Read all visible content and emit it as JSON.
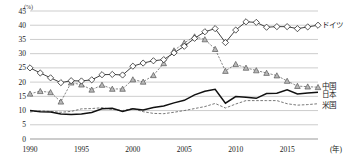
{
  "chart_data": {
    "type": "line",
    "title": "",
    "subtitle": "",
    "xlabel": "(年)",
    "ylabel": "(%)",
    "xlim": [
      1990,
      2018
    ],
    "ylim": [
      0,
      45
    ],
    "yticks": [
      0,
      5,
      10,
      15,
      20,
      25,
      30,
      35,
      40,
      45
    ],
    "xticks": [
      1990,
      1995,
      2000,
      2005,
      2010,
      2015
    ],
    "grid": true,
    "legend_position": "right",
    "x": [
      1990,
      1991,
      1992,
      1993,
      1994,
      1995,
      1996,
      1997,
      1998,
      1999,
      2000,
      2001,
      2002,
      2003,
      2004,
      2005,
      2006,
      2007,
      2008,
      2009,
      2010,
      2011,
      2012,
      2013,
      2014,
      2015,
      2016,
      2017,
      2018
    ],
    "series": [
      {
        "name": "ドイツ",
        "marker": "diamond-open",
        "color": "#111111",
        "values": [
          25.0,
          23.2,
          21.5,
          19.8,
          20.5,
          20.4,
          20.8,
          22.6,
          22.7,
          22.5,
          25.6,
          26.7,
          27.5,
          27.9,
          30.3,
          32.6,
          35.4,
          37.7,
          38.8,
          33.9,
          38.3,
          41.2,
          41.0,
          39.3,
          39.5,
          39.5,
          38.8,
          39.4,
          40.0
        ]
      },
      {
        "name": "中国",
        "marker": "triangle-filled",
        "color": "#8a8a8a",
        "values": [
          15.9,
          16.8,
          16.4,
          13.1,
          19.8,
          19.1,
          17.3,
          19.0,
          17.6,
          17.6,
          20.9,
          20.1,
          22.4,
          26.6,
          31.1,
          33.8,
          36.0,
          35.0,
          31.6,
          23.9,
          26.3,
          25.0,
          24.1,
          23.2,
          22.3,
          20.4,
          18.6,
          18.4,
          18.2
        ]
      },
      {
        "name": "日本",
        "marker": "none",
        "color": "#111111",
        "values": [
          10.0,
          9.6,
          9.5,
          8.8,
          8.6,
          8.8,
          9.3,
          10.6,
          10.8,
          9.7,
          10.6,
          10.2,
          11.1,
          11.6,
          12.7,
          13.6,
          15.5,
          16.8,
          17.5,
          12.6,
          14.9,
          14.7,
          14.3,
          16.0,
          16.1,
          17.3,
          15.8,
          16.2,
          16.4
        ]
      },
      {
        "name": "米国",
        "marker": "none",
        "color": "#6b6b6b",
        "values": [
          9.5,
          9.9,
          9.7,
          9.4,
          9.7,
          10.6,
          10.7,
          11.0,
          10.4,
          10.0,
          10.7,
          9.6,
          9.0,
          8.9,
          9.4,
          10.0,
          10.7,
          11.4,
          12.5,
          10.9,
          12.3,
          13.5,
          13.5,
          13.5,
          13.5,
          12.4,
          11.9,
          12.1,
          12.4
        ]
      }
    ]
  },
  "axes": {
    "y_unit": "(%)",
    "x_unit": "(年)",
    "y_tick_labels": [
      "45",
      "40",
      "35",
      "30",
      "25",
      "20",
      "15",
      "10",
      "5",
      "0"
    ],
    "x_tick_labels": [
      "1990",
      "1995",
      "2000",
      "2005",
      "2010",
      "2015"
    ]
  },
  "legend": {
    "items": [
      {
        "label": "ドイツ",
        "key": "germany"
      },
      {
        "label": "中国",
        "key": "china"
      },
      {
        "label": "日本",
        "key": "japan"
      },
      {
        "label": "米国",
        "key": "usa"
      }
    ]
  },
  "colors": {
    "grid": "#9a9a9a",
    "axis": "#555555",
    "germany": "#111111",
    "china": "#8a8a8a",
    "japan": "#111111",
    "usa": "#6b6b6b",
    "background": "#ffffff"
  }
}
